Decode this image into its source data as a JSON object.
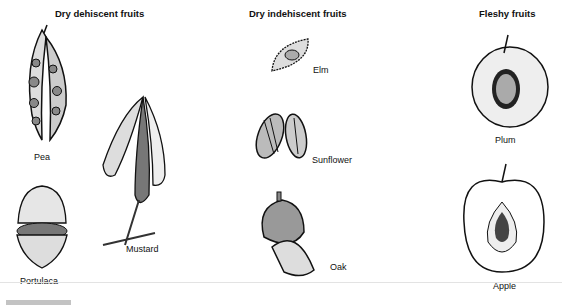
{
  "sections": [
    {
      "title": "Dry dehiscent fruits",
      "items": [
        {
          "label": "Pea",
          "icon": "pea-pod-icon"
        },
        {
          "label": "Mustard",
          "icon": "mustard-silique-icon"
        },
        {
          "label": "Portulaca",
          "icon": "portulaca-capsule-icon"
        }
      ]
    },
    {
      "title": "Dry indehiscent fruits",
      "items": [
        {
          "label": "Elm",
          "icon": "elm-samara-icon"
        },
        {
          "label": "Sunflower",
          "icon": "sunflower-achene-icon"
        },
        {
          "label": "Oak",
          "icon": "acorn-icon"
        }
      ]
    },
    {
      "title": "Fleshy fruits",
      "items": [
        {
          "label": "Plum",
          "icon": "plum-drupe-icon"
        },
        {
          "label": "Apple",
          "icon": "apple-pome-icon"
        }
      ]
    }
  ]
}
